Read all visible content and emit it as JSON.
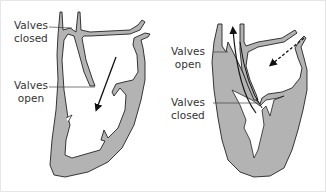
{
  "diagram": {
    "colors": {
      "tissue_fill": "#b3b3b3",
      "outline": "#222222",
      "background": "#ffffff",
      "text": "#333333"
    },
    "panels": [
      {
        "name": "left-heart-filling",
        "labels": [
          {
            "line1": "Valves",
            "line2": "closed"
          },
          {
            "line1": "Valves",
            "line2": "open"
          }
        ],
        "arrows": [
          {
            "style": "solid",
            "direction": "down-left"
          }
        ]
      },
      {
        "name": "right-heart-ejecting",
        "labels": [
          {
            "line1": "Valves",
            "line2": "open"
          },
          {
            "line1": "Valves",
            "line2": "closed"
          }
        ],
        "arrows": [
          {
            "style": "solid",
            "direction": "up"
          },
          {
            "style": "dashed",
            "direction": "down-left"
          }
        ]
      }
    ]
  }
}
